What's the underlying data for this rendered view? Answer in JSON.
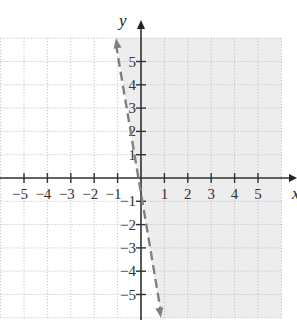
{
  "chart_data": {
    "type": "line",
    "title": "",
    "xlabel": "x",
    "ylabel": "y",
    "xlim": [
      -6,
      6
    ],
    "ylim": [
      -6,
      6
    ],
    "grid": true,
    "grid_style": "dotted",
    "x_ticks": [
      -5,
      -4,
      -3,
      -2,
      -1,
      1,
      2,
      3,
      4,
      5
    ],
    "y_ticks": [
      -5,
      -4,
      -3,
      -2,
      -1,
      1,
      2,
      3,
      4,
      5
    ],
    "x_tick_labels": [
      "−5",
      "−4",
      "−3",
      "−2",
      "−1",
      "1",
      "2",
      "3",
      "4",
      "5"
    ],
    "y_tick_labels": [
      "−5",
      "−4",
      "−3",
      "−2",
      "−1",
      "1",
      "2",
      "3",
      "4",
      "5"
    ],
    "series": [
      {
        "name": "boundary line",
        "style": "dashed",
        "arrows": "both",
        "color": "#808080",
        "points": [
          [
            -1.07,
            6.0
          ],
          [
            0,
            0
          ],
          [
            0.85,
            -6.0
          ]
        ]
      }
    ],
    "shaded_region": {
      "description": "half-plane to the right of the dashed boundary line",
      "side": "right",
      "color": "#ededed"
    }
  },
  "axes": {
    "x_label": "x",
    "y_label": "y"
  }
}
